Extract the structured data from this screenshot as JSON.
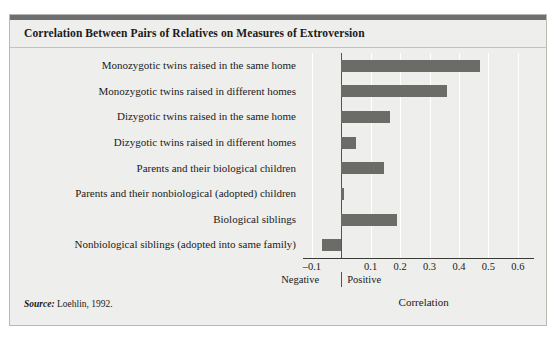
{
  "figure": {
    "title": "Correlation Between Pairs of Relatives on Measures of Extroversion",
    "source_prefix": "Source:",
    "source_text": " Loehlin, 1992.",
    "accent_bar_color": "#6f6f6f",
    "panel_color": "#eeeeec",
    "bar_color": "#6b6b68",
    "gridline_color": "#ffffff",
    "axis_color": "#3a3a36"
  },
  "chart_data": {
    "type": "bar",
    "orientation": "horizontal",
    "title": "Correlation Between Pairs of Relatives on Measures of Extroversion",
    "xlabel": "Correlation",
    "ylabel": "",
    "xlim": [
      -0.13,
      0.655
    ],
    "xticks": [
      -0.1,
      0.1,
      0.2,
      0.3,
      0.4,
      0.5,
      0.6
    ],
    "xticklabels": [
      "–0.1",
      "0.1",
      "0.2",
      "0.3",
      "0.4",
      "0.5",
      "0.6"
    ],
    "grid": true,
    "grid_axis": "x",
    "legend": false,
    "zero_line": 0,
    "sign_labels": {
      "negative": "Negative",
      "positive": "Positive"
    },
    "categories": [
      "Monozygotic twins raised in the same home",
      "Monozygotic twins raised in different homes",
      "Dizygotic twins raised in the same home",
      "Dizygotic twins raised in different homes",
      "Parents and their biological children",
      "Parents and their nonbiological (adopted) children",
      "Biological siblings",
      "Nonbiological siblings (adopted into same family)"
    ],
    "values": [
      0.47,
      0.36,
      0.165,
      0.05,
      0.145,
      0.01,
      0.19,
      -0.065
    ]
  }
}
